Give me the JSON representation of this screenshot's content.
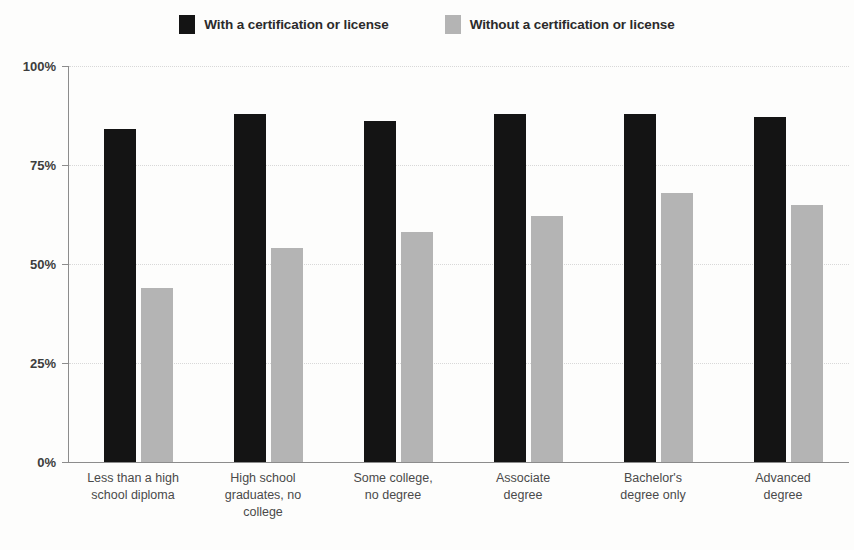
{
  "chart_data": {
    "type": "bar",
    "title": "",
    "subtitle": "",
    "xlabel": "",
    "ylabel": "",
    "ylim": [
      0,
      100
    ],
    "yticks": [
      "0%",
      "25%",
      "50%",
      "75%",
      "100%"
    ],
    "ytick_values": [
      0,
      25,
      50,
      75,
      100
    ],
    "grid": true,
    "legend_position": "top-center",
    "categories": [
      "Less than a high\nschool diploma",
      "High school\ngraduates, no\ncollege",
      "Some college,\nno degree",
      "Associate\ndegree",
      "Bachelor's\ndegree only",
      "Advanced\ndegree"
    ],
    "series": [
      {
        "name": "With a certification or license",
        "color": "#141414",
        "values": [
          84,
          88,
          86,
          88,
          88,
          87
        ]
      },
      {
        "name": "Without a certification or license",
        "color": "#b4b4b4",
        "values": [
          44,
          54,
          58,
          62,
          68,
          65
        ]
      }
    ]
  },
  "legend": {
    "items": [
      {
        "label": "With a certification or license",
        "color": "#141414",
        "swatch": "legend-swatch-dark"
      },
      {
        "label": "Without a certification or license",
        "color": "#b4b4b4",
        "swatch": "legend-swatch-light"
      }
    ]
  },
  "axis": {
    "y_labels": [
      "100%",
      "75%",
      "50%",
      "25%",
      "0%"
    ],
    "axis_color": "#8c8c8c",
    "grid_color": "#d8d8d8"
  }
}
